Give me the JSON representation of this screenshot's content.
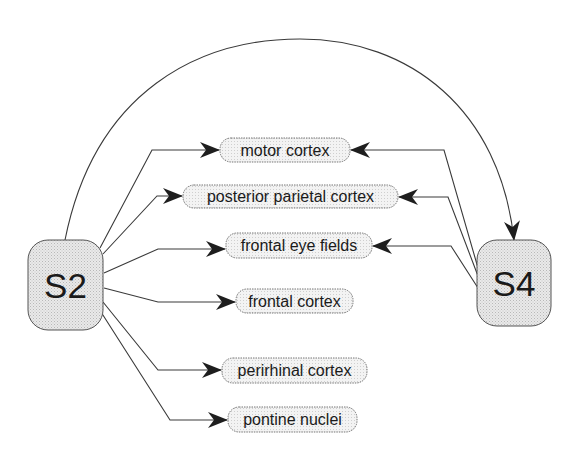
{
  "diagram": {
    "colors": {
      "line": "#3a3a3a",
      "arrowhead": "#1e1e1e",
      "node_fill": "#e6e6e6",
      "target_fill": "#efefef",
      "node_stroke": "#555555",
      "text": "#1a1a1a"
    },
    "sources": [
      {
        "id": "S2",
        "label": "S2"
      },
      {
        "id": "S4",
        "label": "S4"
      }
    ],
    "targets": [
      {
        "id": "motor",
        "label": "motor cortex"
      },
      {
        "id": "ppc",
        "label": "posterior parietal cortex"
      },
      {
        "id": "fef",
        "label": "frontal eye fields"
      },
      {
        "id": "frontal",
        "label": "frontal cortex"
      },
      {
        "id": "perirhinal",
        "label": "perirhinal cortex"
      },
      {
        "id": "pontine",
        "label": "pontine nuclei"
      }
    ],
    "edges": [
      {
        "from": "S2",
        "to": "motor cortex"
      },
      {
        "from": "S2",
        "to": "posterior parietal cortex"
      },
      {
        "from": "S2",
        "to": "frontal eye fields"
      },
      {
        "from": "S2",
        "to": "frontal cortex"
      },
      {
        "from": "S2",
        "to": "perirhinal cortex"
      },
      {
        "from": "S2",
        "to": "pontine nuclei"
      },
      {
        "from": "S2",
        "to": "S4"
      },
      {
        "from": "S4",
        "to": "motor cortex"
      },
      {
        "from": "S4",
        "to": "posterior parietal cortex"
      },
      {
        "from": "S4",
        "to": "frontal eye fields"
      }
    ]
  }
}
